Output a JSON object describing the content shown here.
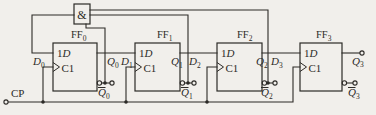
{
  "colors": {
    "paper": "#f1efeb",
    "ink": "#2c2a27"
  },
  "and_gate": {
    "label": "&"
  },
  "clock_input": {
    "label": "CP"
  },
  "flipflops": [
    {
      "name": "FF",
      "sub": "0",
      "data_input": {
        "num": "1",
        "letter": "D"
      },
      "clock_label": "C1"
    },
    {
      "name": "FF",
      "sub": "1",
      "data_input": {
        "num": "1",
        "letter": "D"
      },
      "clock_label": "C1"
    },
    {
      "name": "FF",
      "sub": "2",
      "data_input": {
        "num": "1",
        "letter": "D"
      },
      "clock_label": "C1"
    },
    {
      "name": "FF",
      "sub": "3",
      "data_input": {
        "num": "1",
        "letter": "D"
      },
      "clock_label": "C1"
    }
  ],
  "signals": {
    "d": [
      {
        "letter": "D",
        "sub": "0"
      },
      {
        "letter": "D",
        "sub": "1"
      },
      {
        "letter": "D",
        "sub": "2"
      },
      {
        "letter": "D",
        "sub": "3"
      }
    ],
    "q": [
      {
        "letter": "Q",
        "sub": "0"
      },
      {
        "letter": "Q",
        "sub": "1"
      },
      {
        "letter": "Q",
        "sub": "2"
      },
      {
        "letter": "Q",
        "sub": "3"
      }
    ],
    "q_bar": [
      {
        "letter": "Q",
        "sub": "0",
        "overbar": true
      },
      {
        "letter": "Q",
        "sub": "1",
        "overbar": true
      },
      {
        "letter": "Q",
        "sub": "2",
        "overbar": true
      },
      {
        "letter": "Q",
        "sub": "3",
        "overbar": true
      }
    ]
  }
}
